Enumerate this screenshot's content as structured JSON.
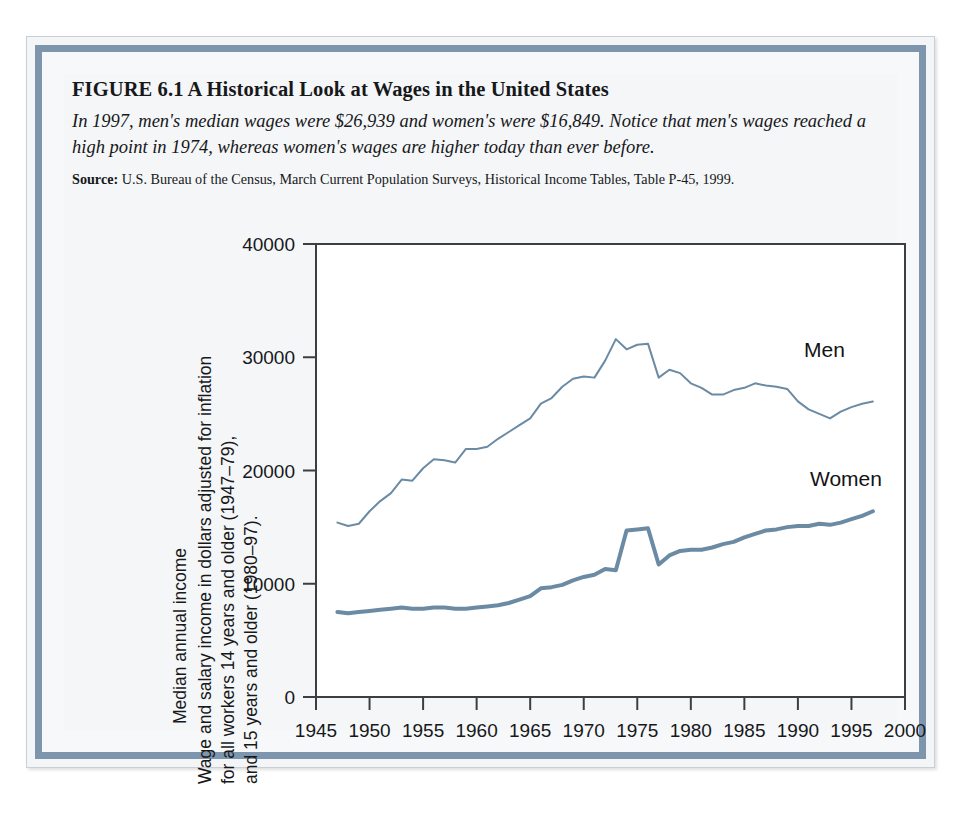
{
  "figure": {
    "title": "FIGURE 6.1  A Historical Look at Wages in the United States",
    "subtitle": "In 1997, men's median wages were $26,939 and women's were $16,849. Notice that men's wages reached a high point in 1974, whereas women's wages are higher today than ever before.",
    "source_label": "Source:",
    "source_text": "U.S. Bureau of the Census, March Current Population Surveys, Historical Income Tables, Table P-45, 1999."
  },
  "colors": {
    "series_line": "#6b8ba4",
    "frame_border": "#7d96ad",
    "axis": "#3c3f42",
    "panel_bg": "#ffffff",
    "figure_bg": "#f4f6f8"
  },
  "axis_labels": {
    "y_main": "Median annual income",
    "y_sub_line1": "Wage and salary income in dollars adjusted for inflation",
    "y_sub_line2": "for all workers 14 years and older (1947–79),",
    "y_sub_line3": "and 15 years and older (1980–97)."
  },
  "chart_data": {
    "type": "line",
    "title": "A Historical Look at Wages in the United States",
    "xlabel": "",
    "ylabel": "Median annual income",
    "xlim": [
      1945,
      2000
    ],
    "ylim": [
      0,
      40000
    ],
    "xticks": [
      1945,
      1950,
      1955,
      1960,
      1965,
      1970,
      1975,
      1980,
      1985,
      1990,
      1995,
      2000
    ],
    "yticks": [
      0,
      10000,
      20000,
      30000,
      40000
    ],
    "xtick_labels": [
      "1945",
      "1950",
      "1955",
      "1960",
      "1965",
      "1970",
      "1975",
      "1980",
      "1985",
      "1990",
      "1995",
      "2000"
    ],
    "ytick_labels": [
      "0",
      "10000",
      "20000",
      "30000",
      "40000"
    ],
    "grid": false,
    "legend": "inline-labels",
    "x": [
      1947,
      1948,
      1949,
      1950,
      1951,
      1952,
      1953,
      1954,
      1955,
      1956,
      1957,
      1958,
      1959,
      1960,
      1961,
      1962,
      1963,
      1964,
      1965,
      1966,
      1967,
      1968,
      1969,
      1970,
      1971,
      1972,
      1973,
      1974,
      1975,
      1976,
      1977,
      1978,
      1979,
      1980,
      1981,
      1982,
      1983,
      1984,
      1985,
      1986,
      1987,
      1988,
      1989,
      1990,
      1991,
      1992,
      1993,
      1994,
      1995,
      1996,
      1997
    ],
    "series": [
      {
        "name": "Men",
        "label": "Men",
        "color": "#6b8ba4",
        "line_width": 2,
        "values": [
          15400,
          15100,
          15300,
          16400,
          17300,
          18000,
          19200,
          19100,
          20200,
          21000,
          20900,
          20700,
          21900,
          21900,
          22100,
          22800,
          23400,
          24000,
          24600,
          25900,
          26400,
          27400,
          28100,
          28300,
          28200,
          29700,
          31600,
          30700,
          31100,
          31200,
          28200,
          28900,
          28600,
          27700,
          27300,
          26700,
          26700,
          27100,
          27300,
          27700,
          27500,
          27400,
          27200,
          26100,
          25400,
          25000,
          24600,
          25200,
          25600,
          25900,
          26100
        ]
      },
      {
        "name": "Women",
        "label": "Women",
        "color": "#6b8ba4",
        "line_width": 4,
        "values": [
          7500,
          7400,
          7500,
          7600,
          7700,
          7800,
          7900,
          7800,
          7800,
          7900,
          7900,
          7800,
          7800,
          7900,
          8000,
          8100,
          8300,
          8600,
          8900,
          9600,
          9700,
          9900,
          10300,
          10600,
          10800,
          11300,
          11200,
          14700,
          14800,
          14900,
          11700,
          12500,
          12900,
          13000,
          13000,
          13200,
          13500,
          13700,
          14100,
          14400,
          14700,
          14800,
          15000,
          15100,
          15100,
          15300,
          15200,
          15400,
          15700,
          16000,
          16400
        ]
      }
    ]
  }
}
